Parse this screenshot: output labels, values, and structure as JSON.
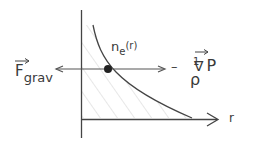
{
  "diagram": {
    "type": "hydrostatic-equilibrium-sketch",
    "axes": {
      "x_label": "r",
      "y_label": ""
    },
    "curve": {
      "label_base": "n",
      "label_sub": "e",
      "label_arg": "(r)",
      "shape": "decreasing, hatched area under curve"
    },
    "forces": {
      "left": {
        "symbol": "F",
        "subscript": "grav",
        "vector_arrow": "→"
      },
      "right": {
        "sign": "–",
        "fraction_numerator": "1",
        "fraction_denominator": "ρ",
        "operator": "∇",
        "operator_vector_arrow": "→",
        "variable": "P"
      }
    },
    "colors": {
      "line": "#444444",
      "hatch": "#c8c8c8",
      "dot": "#222222"
    }
  }
}
